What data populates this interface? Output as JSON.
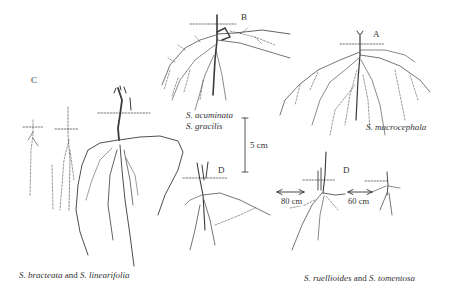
{
  "figure": {
    "panels": {
      "A": {
        "letter": "A",
        "species": "S. macrocephala"
      },
      "B": {
        "letter": "B",
        "species_line1": "S. acuminata",
        "species_line2": "S. gracilis"
      },
      "C": {
        "letter": "C",
        "caption_sp1": "S. bracteata",
        "caption_and": " and ",
        "caption_sp2": "S. linearifolia"
      },
      "D": {
        "letter_left": "D",
        "letter_right": "D",
        "caption_sp1": "S. ruellioides",
        "caption_and": " and ",
        "caption_sp2": "S. tomentosa"
      }
    },
    "scale_bar": {
      "label": "5 cm"
    },
    "distances": {
      "left": "80 cm",
      "right": "60 cm"
    }
  }
}
